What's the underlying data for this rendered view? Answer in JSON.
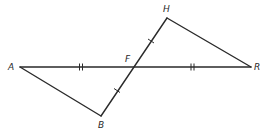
{
  "diagram": {
    "type": "geometry",
    "points": {
      "A": {
        "label": "A",
        "x": 20,
        "y": 67,
        "lx": 8,
        "ly": 70
      },
      "B": {
        "label": "B",
        "x": 101,
        "y": 116,
        "lx": 98,
        "ly": 128
      },
      "F": {
        "label": "F",
        "x": 134,
        "y": 67,
        "lx": 125,
        "ly": 62
      },
      "H": {
        "label": "H",
        "x": 167,
        "y": 18,
        "lx": 163,
        "ly": 12
      },
      "R": {
        "label": "R",
        "x": 251,
        "y": 67,
        "lx": 254,
        "ly": 70
      }
    },
    "segments": [
      {
        "from": "A",
        "to": "R",
        "name": "segment-AR"
      },
      {
        "from": "A",
        "to": "B",
        "name": "segment-AB"
      },
      {
        "from": "B",
        "to": "H",
        "name": "segment-BH"
      },
      {
        "from": "H",
        "to": "R",
        "name": "segment-HR"
      }
    ],
    "congruence_marks": [
      {
        "segment": "AF",
        "ticks": 2
      },
      {
        "segment": "FR",
        "ticks": 2
      },
      {
        "segment": "FH",
        "ticks": 1
      },
      {
        "segment": "FB",
        "ticks": 1
      }
    ],
    "stroke_color": "#2a2a2a"
  }
}
